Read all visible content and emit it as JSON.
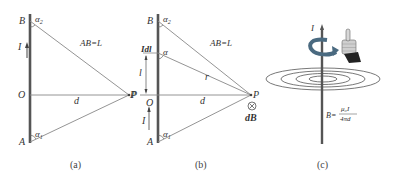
{
  "panels": [
    {
      "id": "a",
      "caption": "(a)",
      "labels": {
        "B": "B",
        "A": "A",
        "O": "O",
        "P": "P",
        "d": "d",
        "I": "I",
        "alpha2": "α",
        "alpha2_sub": "2",
        "alpha1": "α",
        "alpha1_sub": "1",
        "relation": "AB=L"
      }
    },
    {
      "id": "b",
      "caption": "(b)",
      "labels": {
        "B": "B",
        "A": "A",
        "O": "O",
        "P_right": "P",
        "P_left": "P",
        "d": "d",
        "I": "I",
        "Idl": "Idl",
        "l": "l",
        "r": "r",
        "alpha": "α",
        "alpha2": "α",
        "alpha2_sub": "2",
        "alpha1": "α",
        "alpha1_sub": "1",
        "relation": "AB=L",
        "dB": "dB",
        "into_page_symbol": "⊗"
      }
    },
    {
      "id": "c",
      "caption": "(c)",
      "labels": {
        "I": "I",
        "formula_lhs": "B=",
        "formula_num": "μ₀I",
        "formula_den": "4πd"
      },
      "icons": [
        "curl-arrow-icon",
        "thumbs-up-hand-icon"
      ],
      "field_rings": 4
    }
  ],
  "colors": {
    "wire": "#555555",
    "line": "#777777",
    "text": "#333333",
    "curl_arrow": "#4a6a80",
    "hand_skin": "#cfcfcf",
    "sleeve": "#222222"
  }
}
